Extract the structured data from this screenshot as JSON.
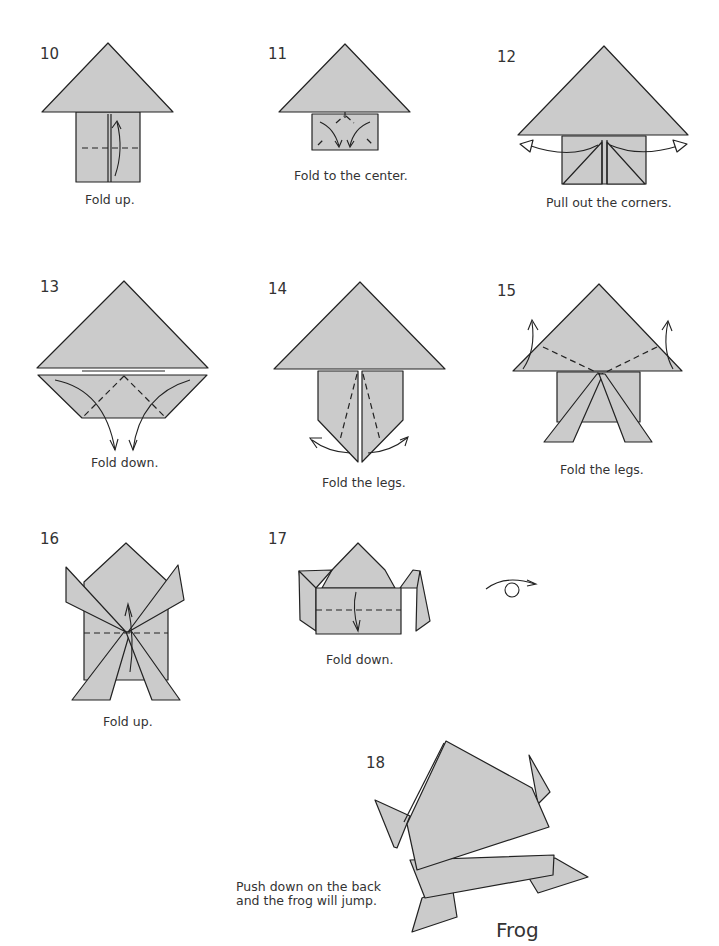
{
  "steps": [
    {
      "number": "10",
      "caption": "Fold up."
    },
    {
      "number": "11",
      "caption": "Fold to the center."
    },
    {
      "number": "12",
      "caption": "Pull out the corners."
    },
    {
      "number": "13",
      "caption": "Fold down."
    },
    {
      "number": "14",
      "caption": "Fold the legs."
    },
    {
      "number": "15",
      "caption": "Fold the legs."
    },
    {
      "number": "16",
      "caption": "Fold up."
    },
    {
      "number": "17",
      "caption": "Fold down."
    },
    {
      "number": "18",
      "caption": ""
    }
  ],
  "turn_over_symbol": "turn-over-icon",
  "final": {
    "title": "Frog",
    "note_line1": "Push down on the back",
    "note_line2": "and the frog will jump."
  },
  "colors": {
    "paper": "#cbcbcb",
    "line": "#222222",
    "background": "#ffffff"
  }
}
